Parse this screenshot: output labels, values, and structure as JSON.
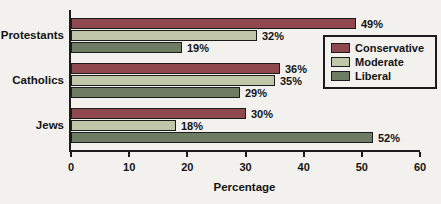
{
  "figure": {
    "background": "#f2f1ed",
    "text_color": "#141414",
    "axis_color": "#1c1c1c"
  },
  "chart_data": {
    "type": "bar",
    "orientation": "horizontal",
    "title": "",
    "categories": [
      "Protestants",
      "Catholics",
      "Jews"
    ],
    "series": [
      {
        "name": "Conservative",
        "color": "#8e484e",
        "values": [
          49,
          36,
          30
        ]
      },
      {
        "name": "Moderate",
        "color": "#bfc7a8",
        "values": [
          32,
          35,
          18
        ]
      },
      {
        "name": "Liberal",
        "color": "#6d7c62",
        "values": [
          19,
          29,
          52
        ]
      }
    ],
    "value_labels": [
      [
        "49%",
        "36%",
        "30%"
      ],
      [
        "32%",
        "35%",
        "18%"
      ],
      [
        "19%",
        "29%",
        "52%"
      ]
    ],
    "xlabel": "Percentage",
    "xlim": [
      0,
      60
    ],
    "xticks": [
      0,
      10,
      20,
      30,
      40,
      50,
      60
    ],
    "grid": false,
    "legend_position": "right-inside"
  }
}
